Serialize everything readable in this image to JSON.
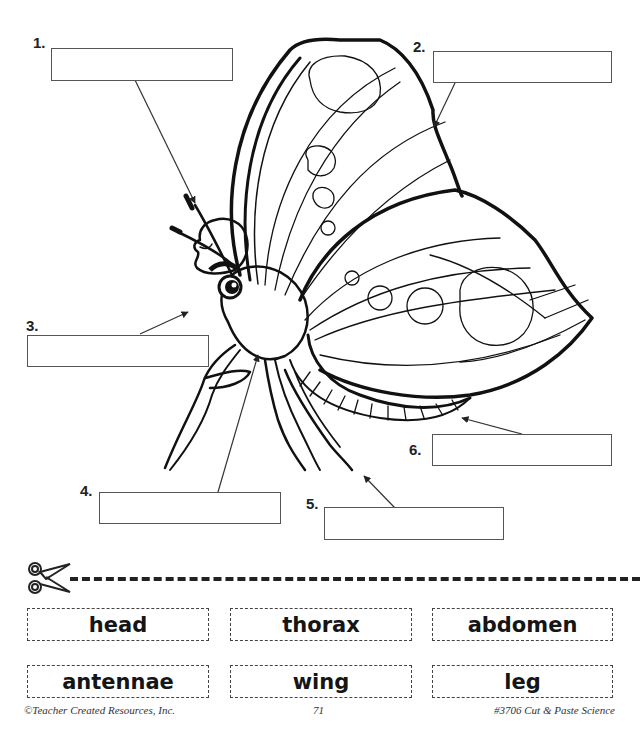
{
  "diagram": {
    "labels": [
      {
        "number": "1.",
        "target": "antennae"
      },
      {
        "number": "2.",
        "target": "wing"
      },
      {
        "number": "3.",
        "target": "head"
      },
      {
        "number": "4.",
        "target": "thorax"
      },
      {
        "number": "5.",
        "target": "leg"
      },
      {
        "number": "6.",
        "target": "abdomen"
      }
    ]
  },
  "cutout": {
    "scissors_icon": "scissors-icon",
    "words": [
      "head",
      "thorax",
      "abdomen",
      "antennae",
      "wing",
      "leg"
    ]
  },
  "footer": {
    "copyright": "©Teacher Created Resources, Inc.",
    "page_number": "71",
    "book": "#3706 Cut & Paste Science"
  },
  "colors": {
    "ink": "#111111",
    "box_border": "#555555"
  }
}
